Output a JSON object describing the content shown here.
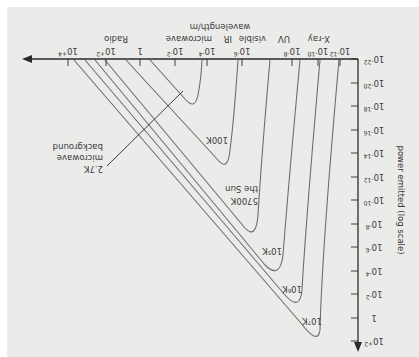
{
  "chart_data": {
    "type": "line",
    "orientation_note": "image is rotated 180 degrees",
    "title": "",
    "xlabel": "wavelength/m",
    "ylabel": "power emitted (log scale)",
    "x_scale": "log",
    "y_scale": "log",
    "x_ticks": [
      "10-12",
      "10-10",
      "10-8",
      "10-6",
      "10-4",
      "10-2",
      "1",
      "10+2",
      "10+4"
    ],
    "y_ticks": [
      "10-22",
      "10-20",
      "10-18",
      "10-16",
      "10-14",
      "10-12",
      "10-10",
      "10-8",
      "10-6",
      "10-4",
      "10-2",
      "1",
      "10+2"
    ],
    "bands": [
      "X-ray",
      "UV",
      "visible",
      "IR",
      "microwave",
      "Radio"
    ],
    "series": [
      {
        "name": "10^7K",
        "peak_wavelength_m": 3e-10,
        "peak_power": 100.0
      },
      {
        "name": "10^6K",
        "peak_wavelength_m": 3e-09,
        "peak_power": 0.1
      },
      {
        "name": "10^5K",
        "peak_wavelength_m": 3e-08,
        "peak_power": 0.0001
      },
      {
        "name": "5700K the Sun",
        "peak_wavelength_m": 5e-07,
        "peak_power": 1e-07
      },
      {
        "name": "100K",
        "peak_wavelength_m": 3e-05,
        "peak_power": 1e-13
      },
      {
        "name": "2.7K microwave background",
        "peak_wavelength_m": 0.001,
        "peak_power": 1e-18
      }
    ]
  },
  "labels": {
    "xlabel": "wavelength/m",
    "ylabel": "power emitted (log scale)",
    "bands": {
      "xray": "X-ray",
      "uv": "UV",
      "visible": "visible",
      "ir": "IR",
      "microwave": "microwave",
      "radio": "Radio"
    },
    "x_ticks": [
      {
        "base": "10",
        "exp": "-12",
        "x": 340
      },
      {
        "base": "10",
        "exp": "-10",
        "x": 318
      },
      {
        "base": "10",
        "exp": "-8",
        "x": 292
      },
      {
        "base": "10",
        "exp": "-6",
        "x": 242
      },
      {
        "base": "10",
        "exp": "-4",
        "x": 207
      },
      {
        "base": "10",
        "exp": "-2",
        "x": 175
      },
      {
        "base": "1",
        "exp": "",
        "x": 140
      },
      {
        "base": "10",
        "exp": "+2",
        "x": 106
      },
      {
        "base": "10",
        "exp": "+4",
        "x": 68
      }
    ],
    "y_ticks": [
      {
        "base": "10",
        "exp": "-22",
        "y": 59
      },
      {
        "base": "10",
        "exp": "-20",
        "y": 83
      },
      {
        "base": "10",
        "exp": "-18",
        "y": 106
      },
      {
        "base": "10",
        "exp": "-16",
        "y": 130
      },
      {
        "base": "10",
        "exp": "-14",
        "y": 153
      },
      {
        "base": "10",
        "exp": "-12",
        "y": 177
      },
      {
        "base": "10",
        "exp": "-10",
        "y": 200
      },
      {
        "base": "10",
        "exp": "-8",
        "y": 224
      },
      {
        "base": "10",
        "exp": "-6",
        "y": 247
      },
      {
        "base": "10",
        "exp": "-4",
        "y": 271
      },
      {
        "base": "10",
        "exp": "-2",
        "y": 294
      },
      {
        "base": "1",
        "exp": "",
        "y": 318
      },
      {
        "base": "10",
        "exp": "+2",
        "y": 341
      }
    ],
    "curves": {
      "t7": "10⁷K",
      "t6": "10⁶K",
      "t5": "10⁵K",
      "sun_temp": "5700K",
      "sun_name": "the Sun",
      "t100": "100K",
      "cmb_temp": "2.7K",
      "cmb_line1": "microwave",
      "cmb_line2": "background"
    }
  },
  "colors": {
    "axis": "#2a2a2a",
    "curve": "#6e6e6e",
    "text": "#3a3a3a",
    "panel": "#ebebe9"
  }
}
